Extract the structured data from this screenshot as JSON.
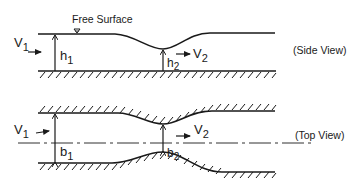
{
  "side_view": {
    "caption": "(Side View)",
    "free_surface_label": "Free Surface",
    "v1_label": "V",
    "v1_sub": "1",
    "v2_label": "V",
    "v2_sub": "2",
    "h1_label": "h",
    "h1_sub": "1",
    "h2_label": "h",
    "h2_sub": "2"
  },
  "top_view": {
    "caption": "(Top View)",
    "v1_label": "V",
    "v1_sub": "1",
    "v2_label": "V",
    "v2_sub": "2",
    "b1_label": "b",
    "b1_sub": "1",
    "b2_label": "b",
    "b2_sub": "2"
  },
  "colors": {
    "ink": "#1a1a1a",
    "background": "#ffffff"
  }
}
